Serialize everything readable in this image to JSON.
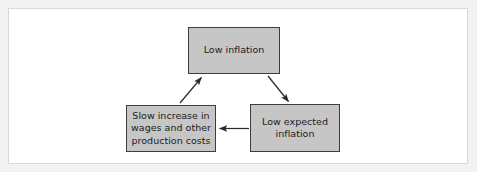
{
  "figure": {
    "type": "cycle-diagram",
    "background_color": "#f2f2f2",
    "frame_color": "#d9d9d9",
    "node_fill_color": "#c6c6c6",
    "node_border_color": "#3d3d3d",
    "arrow_color": "#2b2b2b",
    "text_color": "#1b1b1b"
  },
  "nodes": [
    {
      "id": "low-inflation",
      "label": "Low inflation",
      "position": "top-center"
    },
    {
      "id": "slow-increase-wages",
      "label": "Slow increase in\nwages and other\nproduction costs",
      "position": "bottom-left"
    },
    {
      "id": "low-expected-inflation",
      "label": "Low expected\ninflation",
      "position": "bottom-right"
    }
  ],
  "arrows": [
    {
      "id": "arrow-inflation-to-expected",
      "from": "low-inflation",
      "to": "low-expected-inflation",
      "direction": "down-right"
    },
    {
      "id": "arrow-expected-to-wages",
      "from": "low-expected-inflation",
      "to": "slow-increase-wages",
      "direction": "left"
    },
    {
      "id": "arrow-wages-to-inflation",
      "from": "slow-increase-wages",
      "to": "low-inflation",
      "direction": "up-right"
    }
  ]
}
